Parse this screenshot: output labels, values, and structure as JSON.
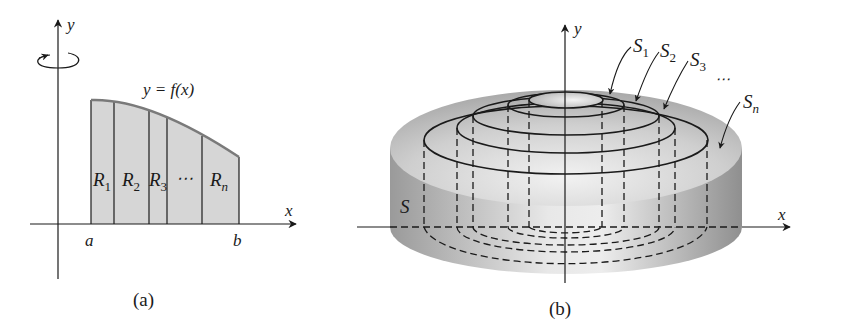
{
  "figure": {
    "panel_a": {
      "caption": "(a)",
      "axis_x_label": "x",
      "axis_y_label": "y",
      "curve_label": "y = f(x)",
      "interval_start_label": "a",
      "interval_end_label": "b",
      "rotation_indicator": "rotation-about-y-axis",
      "strip_labels": [
        "R1",
        "R2",
        "R3",
        "...",
        "Rn"
      ],
      "strip_label_main": [
        "R",
        "R",
        "R",
        "⋯",
        "R"
      ],
      "strip_label_subs": [
        "1",
        "2",
        "3",
        "",
        "n"
      ],
      "fill_color": "#d6d6d6",
      "curve_color": "#7a7a7a"
    },
    "panel_b": {
      "caption": "(b)",
      "axis_x_label": "x",
      "axis_y_label": "y",
      "solid_label": "S",
      "shell_labels": [
        "S1",
        "S2",
        "S3",
        "...",
        "Sn"
      ],
      "shell_label_main": [
        "S",
        "S",
        "S",
        "⋯",
        "S"
      ],
      "shell_label_subs": [
        "1",
        "2",
        "3",
        "",
        "n"
      ],
      "solid_color_light": "#e6e6e6",
      "solid_color_dark": "#9a9a9a"
    }
  }
}
